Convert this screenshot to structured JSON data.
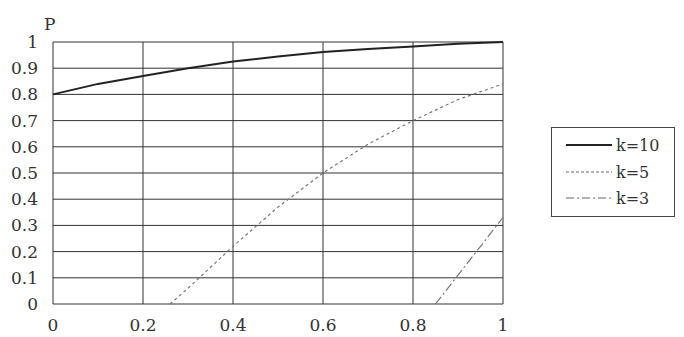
{
  "chart_data": {
    "type": "line",
    "title": "",
    "xlabel": "",
    "ylabel": "P",
    "xlim": [
      0,
      1
    ],
    "ylim": [
      0,
      1
    ],
    "x_ticks": [
      "0",
      "0.2",
      "0.4",
      "0.6",
      "0.8",
      "1"
    ],
    "y_ticks": [
      "0",
      "0.1",
      "0.2",
      "0.3",
      "0.4",
      "0.5",
      "0.6",
      "0.7",
      "0.8",
      "0.9",
      "1"
    ],
    "grid": true,
    "legend_position": "right",
    "series": [
      {
        "name": "k=10",
        "style": "solid",
        "x": [
          0,
          0.1,
          0.2,
          0.3,
          0.4,
          0.5,
          0.6,
          0.7,
          0.8,
          0.9,
          1
        ],
        "y": [
          0.8,
          0.84,
          0.87,
          0.9,
          0.925,
          0.945,
          0.962,
          0.973,
          0.983,
          0.993,
          1.0
        ]
      },
      {
        "name": "k=5",
        "style": "dashed",
        "x": [
          0.26,
          0.3,
          0.4,
          0.5,
          0.6,
          0.7,
          0.8,
          0.9,
          1
        ],
        "y": [
          0,
          0.06,
          0.22,
          0.37,
          0.5,
          0.61,
          0.7,
          0.78,
          0.84
        ]
      },
      {
        "name": "k=3",
        "style": "dashdot",
        "x": [
          0.85,
          0.9,
          1
        ],
        "y": [
          0,
          0.11,
          0.33
        ]
      }
    ]
  },
  "legend": {
    "items": [
      {
        "label": "k=10"
      },
      {
        "label": "k=5"
      },
      {
        "label": "k=3"
      }
    ]
  }
}
